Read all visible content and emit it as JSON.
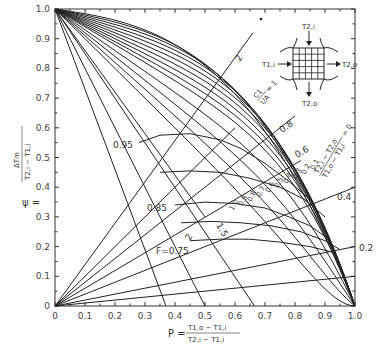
{
  "chart_data": {
    "type": "line",
    "title": "",
    "xlabel": "P = (T1,o - T1,i) / (T2,i - T1,i)",
    "ylabel": "ψ = ΔTm / (T2,i - T1,i)",
    "xlim": [
      0,
      1.0
    ],
    "ylim": [
      0,
      1.0
    ],
    "grid": false,
    "x_ticks": [
      "0",
      "0.1",
      "0.2",
      "0.3",
      "0.4",
      "0.5",
      "0.6",
      "0.7",
      "0.8",
      "0.9",
      "1.0"
    ],
    "y_ticks": [
      "0",
      "0.1",
      "0.2",
      "0.3",
      "0.4",
      "0.5",
      "0.6",
      "0.7",
      "0.8",
      "0.9",
      "1.0"
    ],
    "r_parameter_label": "(T2,i - T2,o)/(T1,o - T1,i)",
    "r_values": [
      0.1,
      0.2,
      0.3,
      0.4,
      0.5,
      0.6,
      0.7,
      0.8,
      0.9,
      1.0
    ],
    "r_value_labels": [
      "1.0",
      "0.9",
      "0.8",
      "0.7",
      "0.6",
      "0.5",
      "0.4",
      "0.3",
      "0.2",
      "0.1"
    ],
    "ntu_parameter_label": "C1/UA = 1",
    "ntu_lines": [
      {
        "label": "2",
        "psi_at_P": [
          [
            0,
            0
          ],
          [
            0.66,
            0.92
          ]
        ]
      },
      {
        "label": "C1/UA = 1",
        "psi_at_P": [
          [
            0,
            0
          ],
          [
            0.6,
            0.6
          ]
        ]
      },
      {
        "label": "0.8",
        "psi_at_P": [
          [
            0,
            0
          ],
          [
            0.8,
            0.64
          ]
        ]
      },
      {
        "label": "0.6",
        "psi_at_P": [
          [
            0,
            0
          ],
          [
            0.82,
            0.49
          ]
        ]
      },
      {
        "label": "0.4",
        "psi_at_P": [
          [
            0,
            0
          ],
          [
            1.0,
            0.4
          ]
        ]
      },
      {
        "label": "0.2",
        "psi_at_P": [
          [
            0,
            0
          ],
          [
            1.0,
            0.2
          ]
        ]
      },
      {
        "label": "",
        "psi_at_P": [
          [
            0,
            0
          ],
          [
            1.0,
            0.1
          ]
        ]
      }
    ],
    "steep_lines": [
      {
        "label": "2",
        "psi_at_P": [
          [
            0,
            1.0
          ],
          [
            0.5,
            0.0
          ]
        ]
      },
      {
        "label": "1.5",
        "psi_at_P": [
          [
            0,
            1.0
          ],
          [
            0.665,
            0.0
          ]
        ]
      }
    ],
    "f_curves": [
      {
        "label": "0.95",
        "points": [
          [
            0.28,
            0.55
          ],
          [
            0.35,
            0.575
          ],
          [
            0.45,
            0.58
          ],
          [
            0.55,
            0.56
          ],
          [
            0.62,
            0.53
          ],
          [
            0.7,
            0.48
          ],
          [
            0.78,
            0.42
          ],
          [
            0.86,
            0.35
          ]
        ]
      },
      {
        "label": "0.85",
        "points": [
          [
            0.4,
            0.34
          ],
          [
            0.5,
            0.35
          ],
          [
            0.6,
            0.345
          ],
          [
            0.7,
            0.33
          ],
          [
            0.78,
            0.3
          ],
          [
            0.85,
            0.27
          ],
          [
            0.92,
            0.22
          ]
        ]
      },
      {
        "label": "F = 0.75",
        "points": [
          [
            0.45,
            0.22
          ],
          [
            0.55,
            0.225
          ],
          [
            0.65,
            0.225
          ],
          [
            0.75,
            0.215
          ],
          [
            0.85,
            0.2
          ],
          [
            0.93,
            0.18
          ]
        ]
      }
    ],
    "inset_labels": {
      "top_in": "T2,i",
      "left_in": "T1,i",
      "right_out": "T2,o",
      "bottom_out": "T2,o"
    },
    "legend_position": "none"
  },
  "labels": {
    "y_axis_psi": "ψ =",
    "y_axis_num": "ΔTm",
    "y_axis_den": "T2,i − T1,i",
    "x_axis_p": "P =",
    "x_axis_num": "T1,o − T1,i",
    "x_axis_den": "T2,i − T1,i",
    "ntu_top": "2",
    "ntu_1_num": "C1",
    "ntu_1_den": "UA",
    "ntu_1_eq": "= 1",
    "ntu_08": "0.8",
    "ntu_06": "0.6",
    "ntu_04": "0.4",
    "ntu_02": "0.2",
    "f_095": "0.95",
    "f_085": "0.85",
    "f_075": "F=0.75",
    "steep_2": "2",
    "steep_15": "1.5",
    "r_num": "T2,i − T2,o",
    "r_den": "T1,o − T1,i",
    "r_eq": "= 0",
    "inset_top": "T2,i",
    "inset_left": "T1,i",
    "inset_right": "T2,o",
    "inset_bottom": "T2,o"
  }
}
